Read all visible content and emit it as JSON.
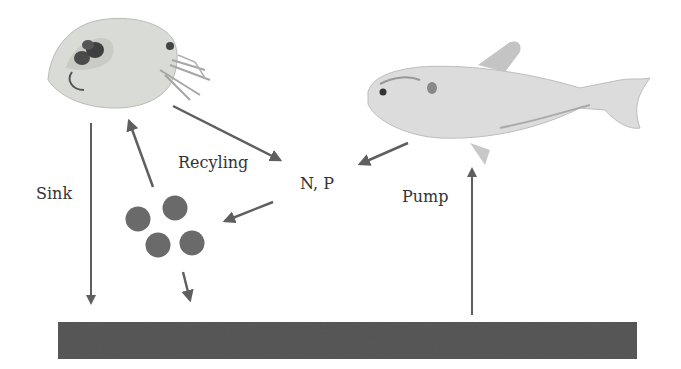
{
  "diagram": {
    "labels": {
      "sink": "Sink",
      "recycling": "Recyling",
      "nutrients": "N, P",
      "pump": "Pump"
    },
    "organisms": {
      "zooplankton": "daphnia-illustration",
      "fish": "fish-illustration"
    },
    "colors": {
      "arrow": "#5f5f5f",
      "sediment": "#595959",
      "particles": "#6a6a6a",
      "text": "#333333",
      "background": "#ffffff"
    },
    "particles_count": 4
  }
}
